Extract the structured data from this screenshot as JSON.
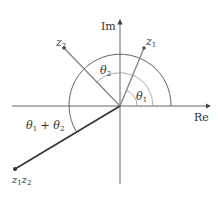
{
  "diagram": {
    "axes": {
      "real_label": "Re",
      "imag_label": "Im"
    },
    "points": {
      "z1": {
        "label": "z",
        "sub": "1"
      },
      "z2": {
        "label": "z",
        "sub": "2"
      },
      "z1z2": {
        "label1": "z",
        "sub1": "1",
        "label2": "z",
        "sub2": "2"
      }
    },
    "angles": {
      "theta1": {
        "label": "θ",
        "sub": "1"
      },
      "theta2": {
        "label": "θ",
        "sub": "2"
      },
      "sum": {
        "label1": "θ",
        "sub1": "1",
        "plus": " + ",
        "label2": "θ",
        "sub2": "2"
      }
    },
    "colors": {
      "axis": "#555555",
      "vector": "#888888",
      "product_vector": "#333333",
      "arc": "#555555",
      "inner_arc": "#999999"
    }
  }
}
